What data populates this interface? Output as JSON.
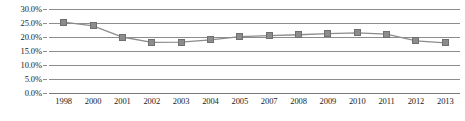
{
  "chart_data": {
    "type": "line",
    "title": "",
    "subtitle": "",
    "xlabel": "",
    "ylabel": "",
    "categories": [
      "1998",
      "2000",
      "2001",
      "2002",
      "2003",
      "2004",
      "2005",
      "2007",
      "2008",
      "2009",
      "2010",
      "2011",
      "2012",
      "2013"
    ],
    "values": [
      25.3,
      24.0,
      20.0,
      18.1,
      18.2,
      19.0,
      20.1,
      20.5,
      20.8,
      21.2,
      21.5,
      21.0,
      18.6,
      17.9
    ],
    "series": [
      {
        "name": "",
        "values": [
          25.3,
          24.0,
          20.0,
          18.1,
          18.2,
          19.0,
          20.1,
          20.5,
          20.8,
          21.2,
          21.5,
          21.0,
          18.6,
          17.9
        ]
      }
    ],
    "ylim": [
      0,
      30
    ],
    "ytick_values": [
      30,
      25,
      20,
      15,
      10,
      5,
      0
    ],
    "ytick_labels": [
      "30.0%",
      "25.0%",
      "20.0%",
      "15.0%",
      "10.0%",
      "5.0%",
      "0.0%"
    ],
    "grid": true,
    "grid_axis": "y",
    "legend": false,
    "legend_position": "none",
    "marker": "square",
    "colors": {
      "line": "#8c8c8c",
      "marker_fill": "#8c8c8c",
      "marker_edge": "#6f6f6f",
      "gridline": "#8d8d8d",
      "text": "#1c1c1c",
      "background": "#ffffff"
    }
  }
}
